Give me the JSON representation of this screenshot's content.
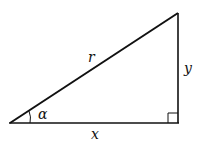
{
  "diagram": {
    "type": "right-triangle",
    "vertices": {
      "origin": [
        10,
        123
      ],
      "top_right": [
        178,
        13
      ],
      "bottom_right": [
        178,
        123
      ]
    },
    "labels": {
      "hypotenuse": "r",
      "vertical_leg": "y",
      "horizontal_leg": "x",
      "angle": "α"
    },
    "stroke_color": "#111111",
    "background": "#ffffff"
  }
}
